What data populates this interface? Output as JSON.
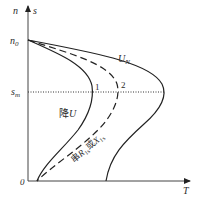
{
  "diagram": {
    "type": "torque-speed characteristic (T-s curves)",
    "axes": {
      "y_label_n": "n",
      "y_label_s": "s",
      "x_label": "T",
      "origin": "0"
    },
    "marks": {
      "n0": {
        "main": "n",
        "sub": "0"
      },
      "sm": {
        "main": "s",
        "sub": "m"
      }
    },
    "curves": [
      {
        "id": "rated-voltage",
        "label_main": "U",
        "label_sub": "N",
        "style": "solid"
      },
      {
        "id": "reduced-voltage",
        "label": "降U",
        "label_prefix": "降",
        "label_var": "U",
        "style": "solid",
        "point": "1"
      },
      {
        "id": "series-impedance",
        "label_prefix": "串",
        "label_R": "R",
        "label_R_sub": "1s",
        "label_or": "或",
        "label_X": "X",
        "label_X_sub": "1s",
        "style": "dashed",
        "point": "2"
      }
    ]
  }
}
